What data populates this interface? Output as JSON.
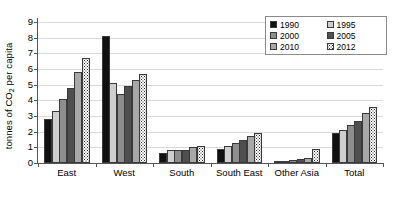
{
  "chart_data": {
    "type": "bar",
    "title": "",
    "xlabel": "",
    "ylabel_plain": "tonnes of CO2 per capita",
    "ylabel_prefix": "tonnes of CO",
    "ylabel_sub": "2",
    "ylabel_suffix": " per capita",
    "categories": [
      "East",
      "West",
      "South",
      "South East",
      "Other Asia",
      "Total"
    ],
    "ylim": [
      0,
      9
    ],
    "yticks": [
      0,
      1,
      2,
      3,
      4,
      5,
      6,
      7,
      8,
      9
    ],
    "ytick_labels": [
      "0",
      "1",
      "2",
      "3",
      "4",
      "5",
      "6",
      "7",
      "8",
      "9"
    ],
    "grid": true,
    "legend_position": "top-right",
    "series": [
      {
        "name": "1990",
        "color": "#111111",
        "pattern": "solid",
        "values": [
          2.8,
          8.1,
          0.65,
          0.9,
          0.15,
          1.9
        ]
      },
      {
        "name": "1995",
        "color": "#cfcfcf",
        "pattern": "solid",
        "values": [
          3.3,
          5.1,
          0.85,
          1.1,
          0.15,
          2.1
        ]
      },
      {
        "name": "2000",
        "color": "#8e8e8e",
        "pattern": "solid",
        "values": [
          4.1,
          4.4,
          0.8,
          1.3,
          0.2,
          2.4
        ]
      },
      {
        "name": "2005",
        "color": "#4f4f4f",
        "pattern": "solid",
        "values": [
          4.8,
          4.9,
          0.85,
          1.5,
          0.25,
          2.7
        ]
      },
      {
        "name": "2010",
        "color": "#a8a8a8",
        "pattern": "solid",
        "values": [
          5.8,
          5.3,
          1.05,
          1.75,
          0.35,
          3.2
        ]
      },
      {
        "name": "2012",
        "color": "#ffffff",
        "pattern": "dotted",
        "values": [
          6.7,
          5.7,
          1.1,
          1.9,
          0.9,
          3.6
        ]
      }
    ]
  },
  "legend": {
    "items": [
      {
        "label": "1990",
        "series_class": "s1990"
      },
      {
        "label": "1995",
        "series_class": "s1995"
      },
      {
        "label": "2000",
        "series_class": "s2000"
      },
      {
        "label": "2005",
        "series_class": "s2005"
      },
      {
        "label": "2010",
        "series_class": "s2010"
      },
      {
        "label": "2012",
        "series_class": "s2012"
      }
    ]
  }
}
